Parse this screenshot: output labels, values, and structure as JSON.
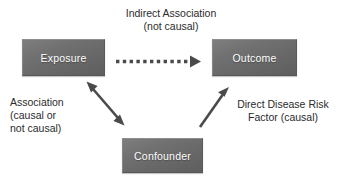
{
  "figure": {
    "background_color": "#ffffff",
    "node_fill_color": "#6b6b6b",
    "node_text_color": "#ffffff",
    "arrow_color": "#4a4a4a",
    "annotation_text_color": "#2b2b2b"
  },
  "nodes": [
    {
      "id": "exposure",
      "label": "Exposure"
    },
    {
      "id": "outcome",
      "label": "Outcome"
    },
    {
      "id": "confounder",
      "label": "Confounder"
    }
  ],
  "annotations": {
    "top": "Indirect Association\n(not causal)",
    "left": "Association\n(causal or\nnot causal)",
    "right": "Direct Disease Risk\nFactor (causal)"
  },
  "edges": [
    {
      "id": "exposure-to-outcome",
      "from": "exposure",
      "to": "outcome",
      "style": "dotted",
      "heads": "single",
      "label": "Indirect Association (not causal)"
    },
    {
      "id": "exposure-confounder",
      "from": "exposure",
      "to": "confounder",
      "style": "solid",
      "heads": "double",
      "label": "Association (causal or not causal)"
    },
    {
      "id": "confounder-to-outcome",
      "from": "confounder",
      "to": "outcome",
      "style": "solid",
      "heads": "single",
      "label": "Direct Disease Risk Factor (causal)"
    }
  ]
}
